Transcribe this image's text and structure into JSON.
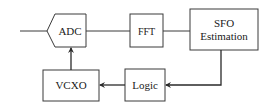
{
  "diagram": {
    "blocks": {
      "adc": {
        "label": "ADC"
      },
      "fft": {
        "label": "FFT"
      },
      "sfo": {
        "line1": "SFO",
        "line2": "Estimation"
      },
      "logic": {
        "label": "Logic"
      },
      "vcxo": {
        "label": "VCXO"
      }
    },
    "connections": [
      {
        "from": "input",
        "to": "adc"
      },
      {
        "from": "adc",
        "to": "fft"
      },
      {
        "from": "fft",
        "to": "sfo"
      },
      {
        "from": "sfo",
        "to": "logic",
        "arrow": true
      },
      {
        "from": "logic",
        "to": "vcxo",
        "arrow": true
      },
      {
        "from": "vcxo",
        "to": "adc",
        "arrow": true
      }
    ],
    "colors": {
      "stroke": "#3a3a3a",
      "background": "#ffffff"
    }
  }
}
